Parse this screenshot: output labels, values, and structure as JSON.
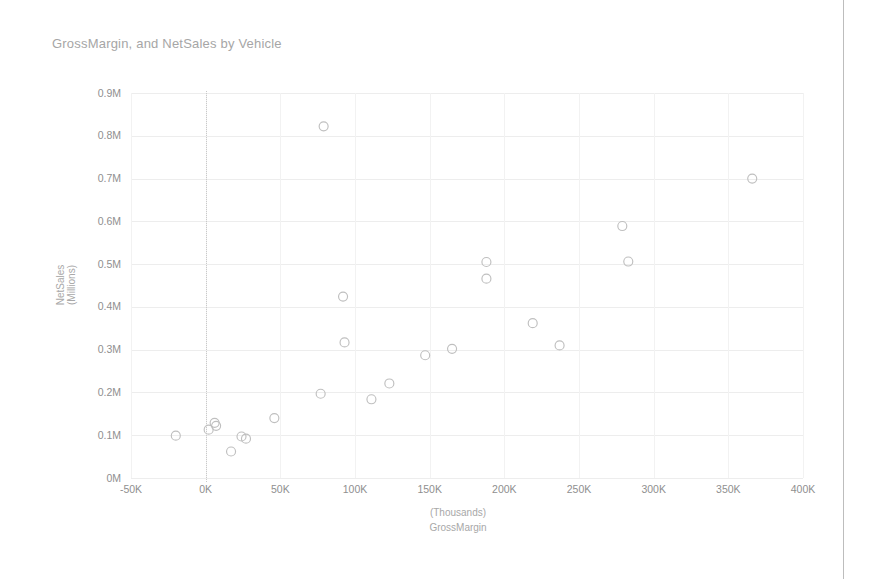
{
  "page": {
    "background_color": "#ffffff",
    "divider_color": "#bdbdbd"
  },
  "chart_title": "GrossMargin, and NetSales by Vehicle",
  "axis": {
    "x": {
      "title_line1": "(Thousands)",
      "title_line2": "GrossMargin",
      "tick_labels": [
        "-50K",
        "0K",
        "50K",
        "100K",
        "150K",
        "200K",
        "250K",
        "300K",
        "350K",
        "400K"
      ]
    },
    "y": {
      "title_line1": "NetSales",
      "title_line2": "(Millions)",
      "tick_labels": [
        "0M",
        "0.1M",
        "0.2M",
        "0.3M",
        "0.4M",
        "0.5M",
        "0.6M",
        "0.7M",
        "0.8M",
        "0.9M"
      ]
    }
  },
  "chart_data": {
    "type": "scatter",
    "title": "GrossMargin, and NetSales by Vehicle",
    "xlabel": "GrossMargin (Thousands)",
    "ylabel": "NetSales (Millions)",
    "xlim": [
      -50000,
      400000
    ],
    "ylim": [
      0,
      900000
    ],
    "xticks": [
      -50000,
      0,
      50000,
      100000,
      150000,
      200000,
      250000,
      300000,
      350000,
      400000
    ],
    "xtick_labels": [
      "-50K",
      "0K",
      "50K",
      "100K",
      "150K",
      "200K",
      "250K",
      "300K",
      "350K",
      "400K"
    ],
    "yticks": [
      0,
      100000,
      200000,
      300000,
      400000,
      500000,
      600000,
      700000,
      800000,
      900000
    ],
    "ytick_labels": [
      "0M",
      "0.1M",
      "0.2M",
      "0.3M",
      "0.4M",
      "0.5M",
      "0.6M",
      "0.7M",
      "0.8M",
      "0.9M"
    ],
    "grid": "horizontal-and-vertical",
    "legend": "none",
    "marker": {
      "shape": "circle-open",
      "color": "#bfbfbf",
      "size": 9
    },
    "reference_lines": [
      {
        "orientation": "vertical",
        "x": 0,
        "style": "dotted",
        "color": "#c9c9c9"
      }
    ],
    "series": [
      {
        "name": "Vehicle",
        "points": [
          {
            "x": -20000,
            "y": 99000
          },
          {
            "x": 2000,
            "y": 113000
          },
          {
            "x": 6000,
            "y": 129000
          },
          {
            "x": 7000,
            "y": 122000
          },
          {
            "x": 17000,
            "y": 62000
          },
          {
            "x": 24000,
            "y": 97000
          },
          {
            "x": 27000,
            "y": 92000
          },
          {
            "x": 46000,
            "y": 140000
          },
          {
            "x": 79000,
            "y": 822000
          },
          {
            "x": 77000,
            "y": 197000
          },
          {
            "x": 92000,
            "y": 424000
          },
          {
            "x": 93000,
            "y": 317000
          },
          {
            "x": 111000,
            "y": 184000
          },
          {
            "x": 123000,
            "y": 221000
          },
          {
            "x": 147000,
            "y": 287000
          },
          {
            "x": 165000,
            "y": 302000
          },
          {
            "x": 188000,
            "y": 505000
          },
          {
            "x": 188000,
            "y": 466000
          },
          {
            "x": 219000,
            "y": 362000
          },
          {
            "x": 237000,
            "y": 310000
          },
          {
            "x": 279000,
            "y": 589000
          },
          {
            "x": 283000,
            "y": 506000
          },
          {
            "x": 366000,
            "y": 700000
          }
        ]
      }
    ]
  }
}
